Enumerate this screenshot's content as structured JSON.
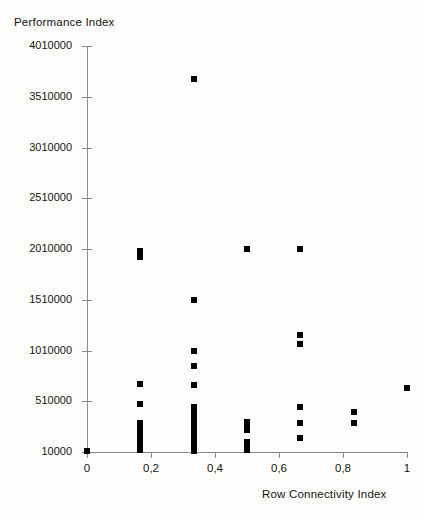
{
  "chart_data": {
    "type": "scatter",
    "title": "Performance Index",
    "xlabel": "Row Connectivity Index",
    "ylabel": "Performance Index",
    "decimal_separator": ",",
    "grid": false,
    "legend": null,
    "marker": {
      "shape": "square",
      "color": "#000000",
      "size_px": 6
    },
    "xlim": [
      0,
      1
    ],
    "ylim": [
      10000,
      4010000
    ],
    "xticks": [
      0,
      0.2,
      0.4,
      0.6,
      0.8,
      1
    ],
    "xtick_labels": [
      "0",
      "0,2",
      "0,4",
      "0,6",
      "0,8",
      "1"
    ],
    "yticks": [
      10000,
      510000,
      1010000,
      1510000,
      2010000,
      2510000,
      3010000,
      3510000,
      4010000
    ],
    "ytick_labels": [
      "10000",
      "510000",
      "1010000",
      "1510000",
      "2010000",
      "2510000",
      "3010000",
      "3510000",
      "4010000"
    ],
    "points": [
      {
        "x": 0.0,
        "y": 20000
      },
      {
        "x": 0.167,
        "y": 1990000
      },
      {
        "x": 0.167,
        "y": 1935000
      },
      {
        "x": 0.167,
        "y": 680000
      },
      {
        "x": 0.167,
        "y": 480000
      },
      {
        "x": 0.167,
        "y": 300000
      },
      {
        "x": 0.167,
        "y": 255000
      },
      {
        "x": 0.167,
        "y": 215000
      },
      {
        "x": 0.167,
        "y": 175000
      },
      {
        "x": 0.167,
        "y": 135000
      },
      {
        "x": 0.167,
        "y": 95000
      },
      {
        "x": 0.167,
        "y": 55000
      },
      {
        "x": 0.167,
        "y": 25000
      },
      {
        "x": 0.333,
        "y": 3680000
      },
      {
        "x": 0.333,
        "y": 1505000
      },
      {
        "x": 0.333,
        "y": 1010000
      },
      {
        "x": 0.333,
        "y": 855000
      },
      {
        "x": 0.333,
        "y": 675000
      },
      {
        "x": 0.333,
        "y": 455000
      },
      {
        "x": 0.333,
        "y": 410000
      },
      {
        "x": 0.333,
        "y": 360000
      },
      {
        "x": 0.333,
        "y": 315000
      },
      {
        "x": 0.333,
        "y": 270000
      },
      {
        "x": 0.333,
        "y": 225000
      },
      {
        "x": 0.333,
        "y": 180000
      },
      {
        "x": 0.333,
        "y": 135000
      },
      {
        "x": 0.333,
        "y": 90000
      },
      {
        "x": 0.333,
        "y": 45000
      },
      {
        "x": 0.333,
        "y": 20000
      },
      {
        "x": 0.5,
        "y": 2010000
      },
      {
        "x": 0.5,
        "y": 310000
      },
      {
        "x": 0.5,
        "y": 265000
      },
      {
        "x": 0.5,
        "y": 225000
      },
      {
        "x": 0.5,
        "y": 110000
      },
      {
        "x": 0.5,
        "y": 60000
      },
      {
        "x": 0.5,
        "y": 25000
      },
      {
        "x": 0.667,
        "y": 2010000
      },
      {
        "x": 0.667,
        "y": 1160000
      },
      {
        "x": 0.667,
        "y": 1075000
      },
      {
        "x": 0.667,
        "y": 450000
      },
      {
        "x": 0.667,
        "y": 295000
      },
      {
        "x": 0.667,
        "y": 150000
      },
      {
        "x": 0.833,
        "y": 400000
      },
      {
        "x": 0.833,
        "y": 300000
      },
      {
        "x": 1.0,
        "y": 645000
      }
    ]
  }
}
